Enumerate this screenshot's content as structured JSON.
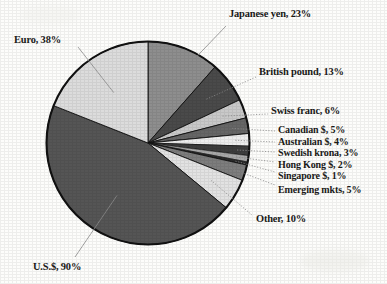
{
  "chart_data": {
    "type": "pie",
    "title": "",
    "subtitle": "",
    "xlabel": "",
    "ylabel": "",
    "legend_position": "callout-labels",
    "grid": false,
    "note": "Percentages are shares of a 200% total (each transaction involves two currencies), so slice angles are percent/2 of the circle.",
    "total_percent": 200,
    "categories": [
      "U.S.$",
      "Euro",
      "Japanese yen",
      "British pound",
      "Swiss franc",
      "Canadian $",
      "Australian $",
      "Swedish krona",
      "Hong Kong $",
      "Singapore $",
      "Emerging mkts",
      "Other"
    ],
    "values": [
      90,
      38,
      23,
      13,
      6,
      5,
      4,
      3,
      2,
      1,
      5,
      10
    ],
    "slices": [
      {
        "label": "Japanese yen, 23%",
        "name": "Japanese yen",
        "value": 23,
        "color": "#8e8e8e"
      },
      {
        "label": "British pound, 13%",
        "name": "British pound",
        "value": 13,
        "color": "#4a4a4a"
      },
      {
        "label": "Swiss franc, 6%",
        "name": "Swiss franc",
        "value": 6,
        "color": "#c9c9c9"
      },
      {
        "label": "Canadian $, 5%",
        "name": "Canadian $",
        "value": 5,
        "color": "#666666"
      },
      {
        "label": "Australian $, 4%",
        "name": "Australian $",
        "value": 4,
        "color": "#ededed"
      },
      {
        "label": "Swedish krona, 3%",
        "name": "Swedish krona",
        "value": 3,
        "color": "#3d3d3d"
      },
      {
        "label": "Hong Kong $, 2%",
        "name": "Hong Kong $",
        "value": 2,
        "color": "#a8a8a8"
      },
      {
        "label": "Singapore $, 1%",
        "name": "Singapore $",
        "value": 1,
        "color": "#2b2b2b"
      },
      {
        "label": "Emerging mkts, 5%",
        "name": "Emerging mkts",
        "value": 5,
        "color": "#7d7d7d"
      },
      {
        "label": "Other, 10%",
        "name": "Other",
        "value": 10,
        "color": "#e2e2e2"
      },
      {
        "label": "U.S.$, 90%",
        "name": "U.S.$",
        "value": 90,
        "color": "#555555"
      },
      {
        "label": "Euro, 38%",
        "name": "Euro",
        "value": 38,
        "color": "#dcdcdc"
      }
    ]
  },
  "labels": {
    "japanese_yen": "Japanese yen, 23%",
    "euro": "Euro, 38%",
    "british_pound": "British pound, 13%",
    "swiss_franc": "Swiss franc, 6%",
    "canadian": "Canadian $, 5%",
    "australian": "Australian $, 4%",
    "swedish_krona": "Swedish krona, 3%",
    "hong_kong": "Hong Kong $, 2%",
    "singapore": "Singapore $, 1%",
    "emerging": "Emerging mkts, 5%",
    "other": "Other, 10%",
    "us_dollar": "U.S.$, 90%"
  },
  "colors": {
    "background": "#fdfdfb",
    "outline": "#111111",
    "text": "#1a1a18",
    "leader": "#8d8d8d"
  }
}
